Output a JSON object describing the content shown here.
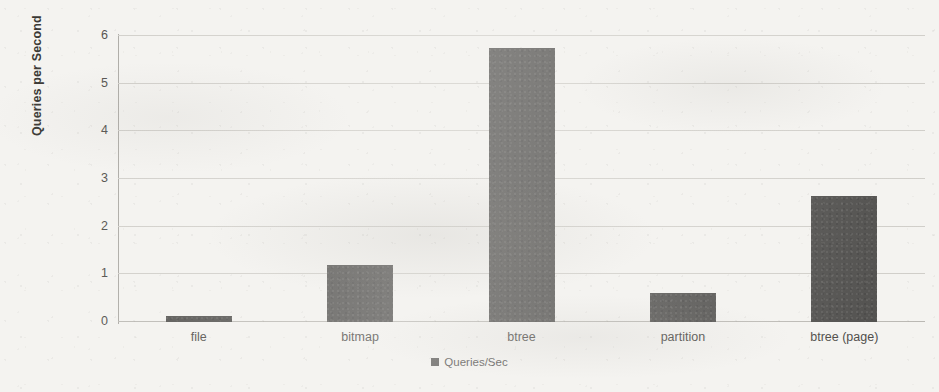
{
  "chart_data": {
    "type": "bar",
    "title": "",
    "subtitle": "",
    "xlabel": "",
    "ylabel": "Queries per Second",
    "categories": [
      "file",
      "bitmap",
      "btree",
      "partition",
      "btree (page)"
    ],
    "series": [
      {
        "name": "Queries/Sec",
        "values": [
          0.12,
          1.2,
          5.74,
          0.61,
          2.64
        ],
        "color": "#4b4a48"
      }
    ],
    "values": [
      0.12,
      1.2,
      5.74,
      0.61,
      2.64
    ],
    "ylim": [
      0,
      6
    ],
    "y_ticks": [
      0,
      1,
      2,
      3,
      4,
      5,
      6
    ],
    "y_tick_labels": [
      "0",
      "1",
      "2",
      "3",
      "4",
      "5",
      "6"
    ],
    "grid": "horizontal",
    "grid_color": "#cfcdc8",
    "legend": {
      "position": "bottom",
      "entries": [
        {
          "label": "Queries/Sec",
          "color": "#4b4a48",
          "marker": "square"
        }
      ]
    },
    "background_color": "#f4f3f0",
    "axis_color": "#a9a7a2"
  }
}
